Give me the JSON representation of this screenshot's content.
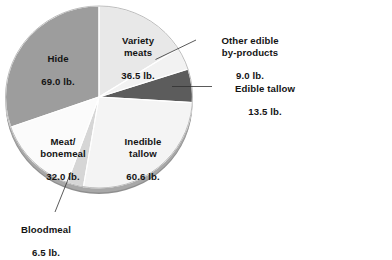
{
  "chart_data": {
    "type": "pie",
    "title": "",
    "subtitle": "",
    "xlabel": "",
    "ylabel": "",
    "unit": "lb.",
    "total": 227.1,
    "legend_position": "none",
    "grid": false,
    "categories": [
      "Variety meats",
      "Other edible by-products",
      "Edible tallow",
      "Inedible tallow",
      "Bloodmeal",
      "Meat/\nbonemeal",
      "Hide"
    ],
    "values": [
      36.5,
      9.0,
      13.5,
      60.6,
      6.5,
      32.0,
      69.0
    ],
    "value_labels": [
      "36.5 lb.",
      "9.0 lb.",
      "13.5 lb.",
      "60.6 lb.",
      "6.5 lb.",
      "32.0 lb.",
      "69.0 lb."
    ],
    "colors": [
      "#e8e8e8",
      "#f2f2f2",
      "#5c5c5c",
      "#f4f4f4",
      "#d6d6d6",
      "#fbfbfb",
      "#9d9d9d"
    ],
    "slices": [
      {
        "name": "Variety meats",
        "label": "Variety\nmeats",
        "value": 36.5,
        "value_label": "36.5 lb.",
        "color": "#e8e8e8",
        "start_deg": 0.0,
        "end_deg": 57.86,
        "leader": false
      },
      {
        "name": "Other edible by-products",
        "label": "Other edible\nby-products",
        "value": 9.0,
        "value_label": "9.0 lb.",
        "color": "#f2f2f2",
        "start_deg": 57.86,
        "end_deg": 72.13,
        "leader": true
      },
      {
        "name": "Edible tallow",
        "label": "Edible tallow",
        "value": 13.5,
        "value_label": "13.5 lb.",
        "color": "#5c5c5c",
        "start_deg": 72.13,
        "end_deg": 93.53,
        "leader": true
      },
      {
        "name": "Inedible tallow",
        "label": "Inedible\ntallow",
        "value": 60.6,
        "value_label": "60.6 lb.",
        "color": "#f4f4f4",
        "start_deg": 93.53,
        "end_deg": 189.6,
        "leader": false
      },
      {
        "name": "Bloodmeal",
        "label": "Bloodmeal",
        "value": 6.5,
        "value_label": "6.5 lb.",
        "color": "#d6d6d6",
        "start_deg": 189.6,
        "end_deg": 199.91,
        "leader": true
      },
      {
        "name": "Meat/bonemeal",
        "label": "Meat/\nbonemeal",
        "value": 32.0,
        "value_label": "32.0 lb.",
        "color": "#fbfbfb",
        "start_deg": 199.91,
        "end_deg": 250.65,
        "leader": false
      },
      {
        "name": "Hide",
        "label": "Hide",
        "value": 69.0,
        "value_label": "69.0 lb.",
        "color": "#9d9d9d",
        "start_deg": 250.65,
        "end_deg": 360.0,
        "leader": false
      }
    ]
  },
  "labels": {
    "variety_meats": {
      "name": "Variety\nmeats",
      "value": "36.5 lb."
    },
    "other_edible": {
      "name": "Other edible\nby-products",
      "value": "9.0 lb."
    },
    "edible_tallow": {
      "name": "Edible tallow",
      "value": "13.5 lb."
    },
    "inedible_tallow": {
      "name": "Inedible\ntallow",
      "value": "60.6 lb."
    },
    "bloodmeal": {
      "name": "Bloodmeal",
      "value": "6.5 lb."
    },
    "meat_bonemeal": {
      "name": "Meat/\nbonemeal",
      "value": "32.0 lb."
    },
    "hide": {
      "name": "Hide",
      "value": "69.0 lb."
    }
  }
}
